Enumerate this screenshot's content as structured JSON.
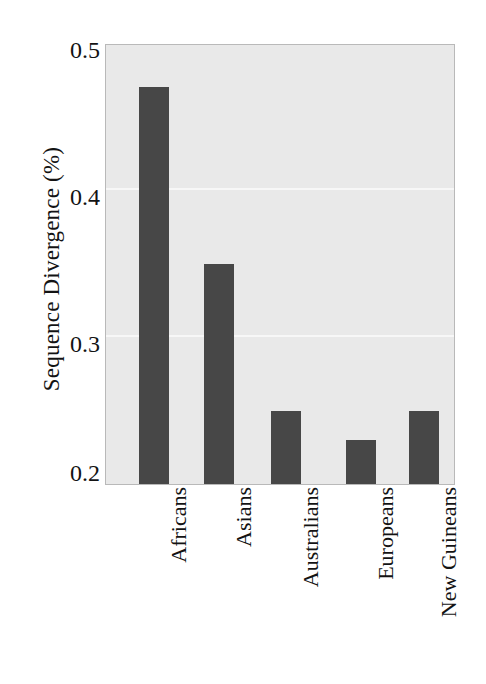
{
  "chart_data": {
    "type": "bar",
    "title": "",
    "xlabel": "",
    "ylabel": "Sequence Divergence (%)",
    "categories": [
      "Africans",
      "Asians",
      "Australians",
      "Europeans",
      "New Guineans"
    ],
    "values": [
      0.47,
      0.35,
      0.25,
      0.23,
      0.25
    ],
    "ylim": [
      0.2,
      0.5
    ],
    "yticks": [
      0.5,
      0.4,
      0.3,
      0.2
    ],
    "ytick_labels": [
      "0.5",
      "0.4",
      "0.3",
      "0.2"
    ],
    "grid": true,
    "gridlines_at": [
      0.4,
      0.3
    ],
    "legend": null,
    "legend_position": "none",
    "bar_color": "#474747",
    "plot_background": "#e9e9e9",
    "gridline_color": "#f7f7f7",
    "frame_color": "#b9b9b9"
  },
  "axis": {
    "y_title": "Sequence Divergence (%)",
    "y_tick_0": "0.5",
    "y_tick_1": "0.4",
    "y_tick_2": "0.3",
    "y_tick_3": "0.2"
  },
  "bars": [
    {
      "label": "Africans",
      "value": "0.47"
    },
    {
      "label": "Asians",
      "value": "0.35"
    },
    {
      "label": "Australians",
      "value": "0.25"
    },
    {
      "label": "Europeans",
      "value": "0.23"
    },
    {
      "label": "New Guineans",
      "value": "0.25"
    }
  ]
}
